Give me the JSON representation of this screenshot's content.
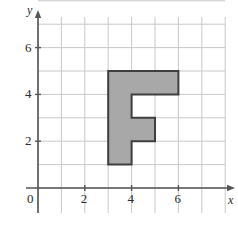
{
  "figure": {
    "name": "coordinate-grid-with-letter-f-polygon",
    "background_color": "#ffffff"
  },
  "chart_data": {
    "type": "scatter",
    "title": "",
    "subtitle": "",
    "xlabel": "x",
    "ylabel": "y",
    "xlim": [
      0,
      8
    ],
    "ylim": [
      0,
      8
    ],
    "grid": true,
    "grid_step": 1,
    "grid_color": "#c8c8c8",
    "axis_color": "#555555",
    "legend": null,
    "x_ticks": [
      0,
      2,
      4,
      6
    ],
    "x_tick_labels": [
      "0",
      "2",
      "4",
      "6"
    ],
    "y_ticks": [
      0,
      2,
      4,
      6
    ],
    "y_tick_labels": [
      "0",
      "2",
      "4",
      "6"
    ],
    "origin_label": "0",
    "shapes": [
      {
        "name": "letter-f-polygon",
        "kind": "polygon",
        "fill": "#a8a8a8",
        "stroke": "#3f3f3f",
        "stroke_width": 2,
        "points": [
          [
            3,
            1
          ],
          [
            3,
            5
          ],
          [
            6,
            5
          ],
          [
            6,
            4
          ],
          [
            4,
            4
          ],
          [
            4,
            3
          ],
          [
            5,
            3
          ],
          [
            5,
            2
          ],
          [
            4,
            2
          ],
          [
            4,
            1
          ]
        ]
      }
    ],
    "annotations": []
  },
  "geometry": {
    "origin_px": [
      38,
      188
    ],
    "unit_px": 23.4,
    "grid_left_px": 38,
    "grid_right_px": 225,
    "grid_top_px": 17,
    "grid_bottom_px": 213
  }
}
